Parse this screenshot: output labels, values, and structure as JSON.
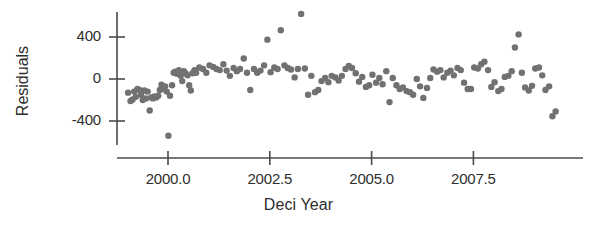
{
  "chart_data": {
    "type": "scatter",
    "title": "",
    "xlabel": "Deci Year",
    "ylabel": "Residuals",
    "xlim": [
      1998.85,
      2009.65
    ],
    "ylim": [
      -700,
      700
    ],
    "grid": false,
    "legend": null,
    "xticks": [
      2000.0,
      2002.5,
      2005.0,
      2007.5
    ],
    "xtick_labels": [
      "2000.0",
      "2002.5",
      "2005.0",
      "2007.5"
    ],
    "yticks": [
      400,
      0,
      -400
    ],
    "ytick_labels": [
      "400",
      "0",
      "-400"
    ],
    "point_color": "#717171",
    "axis_color": "#4a4a4a",
    "marker_size": 4.2,
    "series": [
      {
        "name": "residuals",
        "x": [
          1999.02,
          1999.08,
          1999.13,
          1999.17,
          1999.21,
          1999.25,
          1999.3,
          1999.34,
          1999.38,
          1999.42,
          1999.46,
          1999.5,
          1999.55,
          1999.59,
          1999.63,
          1999.67,
          1999.71,
          1999.76,
          1999.8,
          1999.84,
          1999.88,
          1999.93,
          1999.97,
          2000.01,
          2000.05,
          2000.1,
          2000.14,
          2000.18,
          2000.22,
          2000.27,
          2000.31,
          2000.35,
          2000.39,
          2000.43,
          2000.48,
          2000.52,
          2000.56,
          2000.6,
          2000.65,
          2000.69,
          2000.77,
          2000.86,
          2000.94,
          2001.02,
          2001.11,
          2001.19,
          2001.27,
          2001.36,
          2001.44,
          2001.52,
          2001.61,
          2001.69,
          2001.77,
          2001.86,
          2001.94,
          2002.02,
          2002.11,
          2002.19,
          2002.27,
          2002.36,
          2002.44,
          2002.52,
          2002.61,
          2002.69,
          2002.77,
          2002.86,
          2002.94,
          2003.02,
          2003.11,
          2003.19,
          2003.27,
          2003.36,
          2003.44,
          2003.52,
          2003.61,
          2003.69,
          2003.77,
          2003.86,
          2003.94,
          2004.02,
          2004.11,
          2004.19,
          2004.27,
          2004.36,
          2004.44,
          2004.52,
          2004.61,
          2004.69,
          2004.77,
          2004.86,
          2004.94,
          2005.02,
          2005.11,
          2005.19,
          2005.27,
          2005.36,
          2005.44,
          2005.52,
          2005.61,
          2005.69,
          2005.77,
          2005.86,
          2005.94,
          2006.02,
          2006.11,
          2006.19,
          2006.27,
          2006.36,
          2006.44,
          2006.52,
          2006.61,
          2006.69,
          2006.77,
          2006.86,
          2006.94,
          2007.02,
          2007.11,
          2007.19,
          2007.27,
          2007.36,
          2007.44,
          2007.52,
          2007.61,
          2007.69,
          2007.77,
          2007.86,
          2007.94,
          2008.02,
          2008.11,
          2008.19,
          2008.27,
          2008.36,
          2008.44,
          2008.52,
          2008.61,
          2008.69,
          2008.77,
          2008.86,
          2008.94,
          2009.02,
          2009.11,
          2009.19,
          2009.27,
          2009.36,
          2009.44,
          2009.52
        ],
        "y": [
          -130,
          -210,
          -195,
          -120,
          -170,
          -95,
          -105,
          -150,
          -200,
          -110,
          -185,
          -120,
          -300,
          -175,
          -185,
          -165,
          -175,
          -160,
          -105,
          -55,
          -95,
          -70,
          -120,
          -540,
          -160,
          -60,
          60,
          70,
          50,
          85,
          30,
          -20,
          75,
          55,
          35,
          -60,
          -110,
          55,
          85,
          60,
          110,
          95,
          60,
          130,
          115,
          95,
          85,
          140,
          80,
          30,
          105,
          75,
          95,
          195,
          60,
          -105,
          95,
          60,
          80,
          130,
          375,
          65,
          110,
          95,
          465,
          130,
          105,
          90,
          15,
          95,
          620,
          100,
          -150,
          30,
          -125,
          -105,
          -20,
          10,
          -30,
          30,
          15,
          -15,
          30,
          95,
          125,
          105,
          55,
          -25,
          20,
          -75,
          -60,
          40,
          -35,
          10,
          -50,
          75,
          -220,
          10,
          -60,
          -95,
          -80,
          -115,
          -125,
          -150,
          0,
          -70,
          -180,
          -85,
          10,
          90,
          70,
          85,
          15,
          60,
          80,
          35,
          105,
          85,
          -35,
          -95,
          -95,
          110,
          100,
          140,
          165,
          85,
          -75,
          -30,
          -115,
          -95,
          20,
          30,
          75,
          300,
          425,
          60,
          -80,
          -110,
          -65,
          100,
          110,
          35,
          -105,
          -70,
          -355,
          -310
        ]
      }
    ]
  },
  "axis_geometry": {
    "plot_left_px": 117,
    "plot_right_px": 583,
    "x_axis_y_px": 158,
    "y_axis_x_px": 117,
    "y_axis_top_px": 12,
    "y_axis_bottom_px": 145,
    "px_per_year": 40.72,
    "year_origin": 2000.0,
    "year_origin_px": 168,
    "px_per_unit_y": 0.105,
    "zero_y_px": 79
  }
}
